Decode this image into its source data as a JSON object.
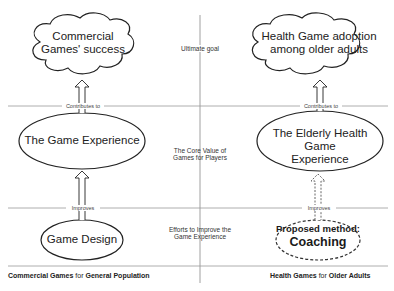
{
  "diagram": {
    "left_column": {
      "goal": "Commercial Games' success",
      "goal_line1": "Commercial",
      "goal_line2": "Games' success",
      "experience": "The Game Experience",
      "method": "Game Design",
      "footer_bold1": "Commercial Games",
      "footer_mid": " for ",
      "footer_bold2": "General Population"
    },
    "right_column": {
      "goal_line1": "Health Game adoption",
      "goal_line2": "among older adults",
      "experience_line1": "The Elderly Health Game",
      "experience_line2": "Experience",
      "method_line1": "Proposed method:",
      "method_line2": "Coaching",
      "footer_bold1": "Health Games",
      "footer_mid": " for ",
      "footer_bold2": "Older Adults"
    },
    "rows": {
      "goal_label": "Ultimate goal",
      "value_label_line1": "The Core Value of",
      "value_label_line2": "Games for Players",
      "effort_label_line1": "Efforts to Improve the",
      "effort_label_line2": "Game Experience"
    },
    "edges": {
      "contributes_left": "Contributes to",
      "contributes_right": "Contributes to",
      "improves_left": "Improves",
      "improves_right": "Improves"
    }
  }
}
